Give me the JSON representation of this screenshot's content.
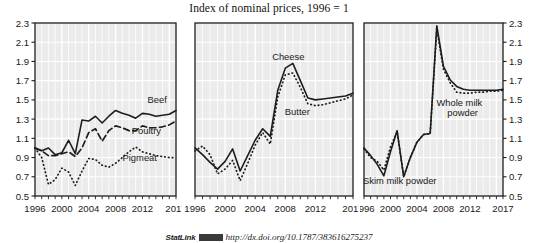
{
  "figure": {
    "title": "Index of nominal prices, 1996 = 1",
    "statlink_label": "StatLink",
    "statlink_url": "http://dx.doi.org/10.1787/383616275237"
  },
  "chart_data": [
    {
      "type": "line",
      "panel": "meat",
      "title": "Index of nominal prices, 1996 = 1",
      "xlabel": "",
      "ylabel": "",
      "xlim": [
        1996,
        2017
      ],
      "ylim": [
        0.5,
        2.3
      ],
      "grid": true,
      "legend_position": "inline-right",
      "xticks": [
        1996,
        2000,
        2004,
        2008,
        2012,
        2017
      ],
      "xticklabels": [
        "1996",
        "2000",
        "2004",
        "2008",
        "2012",
        "2017"
      ],
      "yticks": [
        0.5,
        0.7,
        0.9,
        1.1,
        1.3,
        1.5,
        1.7,
        1.9,
        2.1,
        2.3
      ],
      "yticklabels": [
        "0.5",
        "0.7",
        "0.9",
        "1.1",
        "1.3",
        "1.5",
        "1.7",
        "1.9",
        "2.1",
        "2.3"
      ],
      "yaxis_side": "left",
      "x": [
        1996,
        1997,
        1998,
        1999,
        2000,
        2001,
        2002,
        2003,
        2004,
        2005,
        2006,
        2007,
        2008,
        2009,
        2010,
        2011,
        2012,
        2013,
        2014,
        2015,
        2016,
        2017
      ],
      "series": [
        {
          "name": "Beef",
          "style": "solid",
          "values": [
            1.0,
            0.97,
            1.0,
            0.93,
            0.95,
            1.08,
            0.94,
            1.29,
            1.28,
            1.33,
            1.26,
            1.33,
            1.39,
            1.36,
            1.34,
            1.31,
            1.36,
            1.35,
            1.33,
            1.34,
            1.35,
            1.39
          ]
        },
        {
          "name": "Poultry",
          "style": "dashed",
          "values": [
            1.0,
            0.97,
            0.92,
            0.92,
            0.94,
            0.96,
            0.91,
            1.0,
            1.16,
            1.2,
            1.07,
            1.18,
            1.23,
            1.21,
            1.18,
            1.18,
            1.23,
            1.21,
            1.21,
            1.22,
            1.24,
            1.28
          ]
        },
        {
          "name": "Pigmeat",
          "style": "dotted",
          "values": [
            1.0,
            0.9,
            0.62,
            0.67,
            0.79,
            0.75,
            0.61,
            0.76,
            0.89,
            0.88,
            0.82,
            0.8,
            0.84,
            0.9,
            0.96,
            1.01,
            0.96,
            0.94,
            0.92,
            0.91,
            0.9,
            0.9
          ]
        }
      ]
    },
    {
      "type": "line",
      "panel": "dairy",
      "xlabel": "",
      "ylabel": "",
      "xlim": [
        1996,
        2017
      ],
      "ylim": [
        0.5,
        2.3
      ],
      "grid": true,
      "legend_position": "inline",
      "xticks": [
        1996,
        2000,
        2004,
        2008,
        2012,
        2017
      ],
      "xticklabels": [
        "1996",
        "2000",
        "2004",
        "2008",
        "2012",
        "2017"
      ],
      "yticks": [
        0.5,
        0.7,
        0.9,
        1.1,
        1.3,
        1.5,
        1.7,
        1.9,
        2.1,
        2.3
      ],
      "yticklabels": [],
      "yaxis_side": "none",
      "x": [
        1996,
        1997,
        1998,
        1999,
        2000,
        2001,
        2002,
        2003,
        2004,
        2005,
        2006,
        2007,
        2008,
        2009,
        2010,
        2011,
        2012,
        2013,
        2014,
        2015,
        2016,
        2017
      ],
      "series": [
        {
          "name": "Cheese",
          "style": "solid",
          "values": [
            1.0,
            0.93,
            0.85,
            0.78,
            0.86,
            0.99,
            0.76,
            0.92,
            1.08,
            1.2,
            1.12,
            1.6,
            1.83,
            1.88,
            1.7,
            1.52,
            1.5,
            1.51,
            1.52,
            1.53,
            1.54,
            1.57
          ]
        },
        {
          "name": "Butter",
          "style": "dotted",
          "values": [
            0.97,
            1.02,
            0.93,
            0.73,
            0.78,
            0.87,
            0.66,
            0.84,
            1.03,
            1.16,
            1.04,
            1.53,
            1.76,
            1.78,
            1.63,
            1.46,
            1.44,
            1.45,
            1.47,
            1.49,
            1.51,
            1.55
          ]
        }
      ]
    },
    {
      "type": "line",
      "panel": "milk-powder",
      "xlabel": "",
      "ylabel": "",
      "xlim": [
        1996,
        2017
      ],
      "ylim": [
        0.5,
        2.3
      ],
      "grid": true,
      "legend_position": "inline",
      "xticks": [
        1996,
        2000,
        2004,
        2008,
        2012,
        2017
      ],
      "xticklabels": [
        "1996",
        "2000",
        "2004",
        "2008",
        "2012",
        "2017"
      ],
      "yticks": [
        0.5,
        0.7,
        0.9,
        1.1,
        1.3,
        1.5,
        1.7,
        1.9,
        2.1,
        2.3
      ],
      "yticklabels": [
        "0.5",
        "0.7",
        "0.9",
        "1.1",
        "1.3",
        "1.5",
        "1.7",
        "1.9",
        "2.1",
        "2.3"
      ],
      "yaxis_side": "right",
      "x": [
        1996,
        1997,
        1998,
        1999,
        2000,
        2001,
        2002,
        2003,
        2004,
        2005,
        2006,
        2007,
        2008,
        2009,
        2010,
        2011,
        2012,
        2013,
        2014,
        2015,
        2016,
        2017
      ],
      "series": [
        {
          "name": "Whole milk powder",
          "style": "solid",
          "values": [
            1.0,
            0.92,
            0.83,
            0.71,
            0.96,
            1.18,
            0.7,
            0.9,
            1.06,
            1.14,
            1.15,
            2.27,
            1.85,
            1.71,
            1.64,
            1.61,
            1.6,
            1.6,
            1.6,
            1.6,
            1.6,
            1.61
          ]
        },
        {
          "name": "Skim milk powder",
          "style": "dotted",
          "values": [
            0.99,
            0.9,
            0.86,
            0.77,
            1.01,
            1.17,
            0.7,
            0.9,
            1.06,
            1.14,
            1.15,
            2.24,
            1.82,
            1.68,
            1.58,
            1.57,
            1.57,
            1.58,
            1.58,
            1.59,
            1.59,
            1.6
          ]
        }
      ]
    }
  ],
  "panels": {
    "meat": {
      "annotations": [
        {
          "text": "Beef",
          "x": 2014.2,
          "y": 1.47
        },
        {
          "text": "Poultry",
          "x": 2012.6,
          "y": 1.14
        },
        {
          "text": "Pigmeat",
          "x": 2011.6,
          "y": 0.86
        }
      ]
    },
    "dairy": {
      "annotations": [
        {
          "text": "Cheese",
          "x": 2008.4,
          "y": 1.92
        },
        {
          "text": "Butter",
          "x": 2009.6,
          "y": 1.34
        }
      ]
    },
    "milk-powder": {
      "annotations": [
        {
          "text": "Whole milk",
          "x": 2010.4,
          "y": 1.44
        },
        {
          "text": "powder",
          "x": 2010.9,
          "y": 1.33
        },
        {
          "text": "Skim milk powder",
          "x": 2001.4,
          "y": 0.62
        }
      ]
    }
  },
  "colors": {
    "plot_background": "#ebebeb",
    "gridline": "#ffffff",
    "axis": "#1d1d1d",
    "series_line": "#1d1d1d",
    "text": "#1a1a1a"
  }
}
